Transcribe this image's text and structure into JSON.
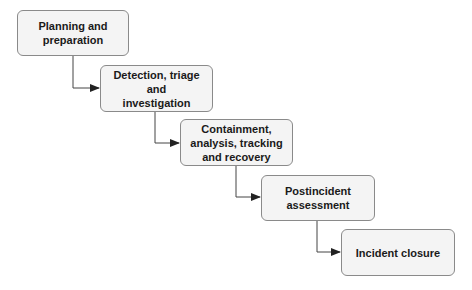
{
  "diagram": {
    "type": "waterfall-process-flow",
    "colors": {
      "box_fill": "#f4f4f4",
      "box_border": "#8a8a8a",
      "connector": "#333333",
      "text": "#1a1a1a"
    },
    "steps": [
      {
        "id": "step-1",
        "label": "Planning and preparation",
        "lines": [
          "Planning and",
          "preparation"
        ]
      },
      {
        "id": "step-2",
        "label": "Detection, triage and investigation",
        "lines": [
          "Detection, triage and",
          "investigation"
        ]
      },
      {
        "id": "step-3",
        "label": "Containment, analysis, tracking and recovery",
        "lines": [
          "Containment,",
          "analysis, tracking",
          "and recovery"
        ]
      },
      {
        "id": "step-4",
        "label": "Postincident assessment",
        "lines": [
          "Postincident",
          "assessment"
        ]
      },
      {
        "id": "step-5",
        "label": "Incident closure",
        "lines": [
          "Incident closure"
        ]
      }
    ],
    "edges": [
      {
        "from": "step-1",
        "to": "step-2"
      },
      {
        "from": "step-2",
        "to": "step-3"
      },
      {
        "from": "step-3",
        "to": "step-4"
      },
      {
        "from": "step-4",
        "to": "step-5"
      }
    ]
  }
}
